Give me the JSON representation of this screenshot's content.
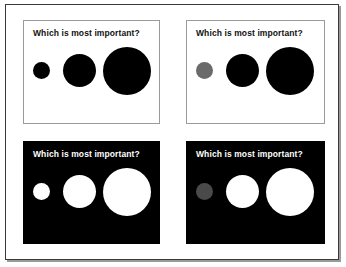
{
  "document": {
    "frame_border_color": "#3a3a3a",
    "background": "#ffffff"
  },
  "palette": {
    "black": "#000000",
    "white": "#ffffff",
    "gray_on_white": "#6a6a6a",
    "gray_on_black": "#4a4a4a",
    "panel_border_light": "#9b9b9b"
  },
  "panels": [
    {
      "id": "top-left",
      "variant": "light",
      "title": "Which is most important?",
      "background": "#ffffff",
      "title_color": "#111111",
      "circles": [
        {
          "size": "small",
          "label": "small circle",
          "color": "#000000"
        },
        {
          "size": "medium",
          "label": "medium circle",
          "color": "#000000"
        },
        {
          "size": "large",
          "label": "large circle",
          "color": "#000000"
        }
      ]
    },
    {
      "id": "top-right",
      "variant": "light",
      "title": "Which is most important?",
      "background": "#ffffff",
      "title_color": "#111111",
      "circles": [
        {
          "size": "small",
          "label": "small circle",
          "color": "#6a6a6a"
        },
        {
          "size": "medium",
          "label": "medium circle",
          "color": "#000000"
        },
        {
          "size": "large",
          "label": "large circle",
          "color": "#000000"
        }
      ]
    },
    {
      "id": "bottom-left",
      "variant": "dark",
      "title": "Which is most important?",
      "background": "#000000",
      "title_color": "#ffffff",
      "circles": [
        {
          "size": "small",
          "label": "small circle",
          "color": "#ffffff"
        },
        {
          "size": "medium",
          "label": "medium circle",
          "color": "#ffffff"
        },
        {
          "size": "large",
          "label": "large circle",
          "color": "#ffffff"
        }
      ]
    },
    {
      "id": "bottom-right",
      "variant": "dark",
      "title": "Which is most important?",
      "background": "#000000",
      "title_color": "#ffffff",
      "circles": [
        {
          "size": "small",
          "label": "small circle",
          "color": "#4a4a4a"
        },
        {
          "size": "medium",
          "label": "medium circle",
          "color": "#ffffff"
        },
        {
          "size": "large",
          "label": "large circle",
          "color": "#ffffff"
        }
      ]
    }
  ]
}
